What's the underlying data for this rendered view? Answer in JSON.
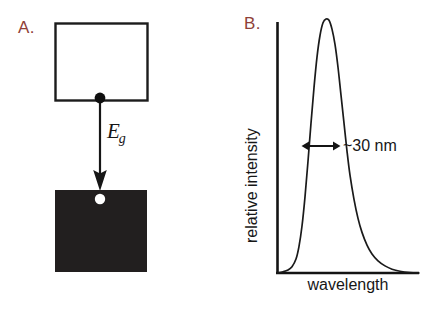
{
  "figure": {
    "background_color": "#ffffff",
    "width": 437,
    "height": 309,
    "ink_color": "#161616",
    "panel_label_color": "#8f4038"
  },
  "panel_a": {
    "label": "A.",
    "name": "band-gap-recombination-diagram",
    "conduction_band": {
      "fill_color": "#ffffff",
      "stroke_color": "#1c1c1c",
      "x": 55,
      "y": 23,
      "width": 92,
      "height": 77
    },
    "valence_band": {
      "fill_color": "#221f1f",
      "x": 55,
      "y": 190,
      "width": 92,
      "height": 82
    },
    "electron": {
      "name": "electron-dot",
      "fill_color": "#0f0f0f",
      "cx": 100,
      "cy": 98,
      "r": 5.2
    },
    "hole": {
      "name": "hole-dot",
      "fill_color": "#ffffff",
      "cx": 100,
      "cy": 199,
      "r": 5.2
    },
    "transition_arrow": {
      "name": "band-gap-arrow",
      "x": 100,
      "y_start": 100,
      "y_end": 190
    },
    "energy_label": {
      "symbol": "E",
      "subscript": "g"
    }
  },
  "panel_b": {
    "label": "B.",
    "name": "emission-spectrum-plot",
    "width_annotation": "~30 nm",
    "axes": {
      "x_origin": 277,
      "y_origin": 273,
      "x_end": 419,
      "y_top": 22,
      "stroke_color": "#141414"
    },
    "fwhm_marker": {
      "name": "fwhm-double-arrow",
      "x_left": 303,
      "x_right": 339,
      "y": 146
    }
  },
  "chart_data": {
    "type": "line",
    "title": "",
    "xlabel": "wavelength",
    "ylabel": "relative intensity",
    "grid": false,
    "legend": null,
    "axis_ticks": {
      "x": [],
      "y": []
    },
    "annotations": [
      {
        "text": "~30 nm",
        "meaning": "full width at half maximum of emission peak",
        "x_range_px": [
          303,
          339
        ],
        "y_px": 146
      }
    ],
    "series": [
      {
        "name": "photoluminescence emission",
        "description": "single asymmetric emission peak, narrow rising edge with broader red-side tail",
        "peak_x_px": 330,
        "peak_y_px": 19,
        "baseline_y_px": 273,
        "x": [
          277,
          283,
          288,
          292,
          296,
          299,
          302,
          305,
          308,
          311,
          314,
          317,
          320,
          323,
          326,
          329,
          332,
          335,
          338,
          341,
          344,
          347,
          350,
          354,
          358,
          362,
          367,
          372,
          378,
          385,
          392,
          400,
          410,
          419
        ],
        "y": [
          0.0,
          0.005,
          0.012,
          0.025,
          0.055,
          0.105,
          0.185,
          0.3,
          0.44,
          0.59,
          0.73,
          0.85,
          0.935,
          0.985,
          1.0,
          0.995,
          0.96,
          0.9,
          0.81,
          0.7,
          0.59,
          0.48,
          0.385,
          0.29,
          0.215,
          0.16,
          0.11,
          0.075,
          0.048,
          0.028,
          0.015,
          0.007,
          0.002,
          0.0
        ]
      }
    ]
  }
}
